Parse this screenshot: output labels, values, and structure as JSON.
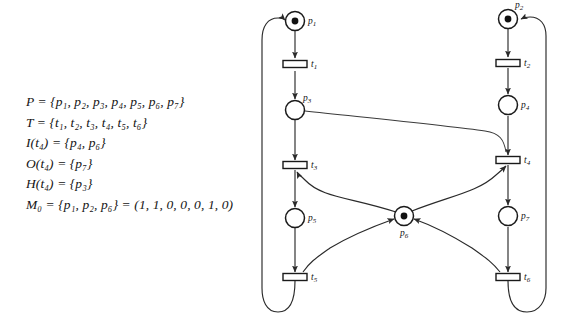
{
  "figure": {
    "kind": "petri-net-with-inhibitor-arc",
    "background_color": "#ffffff",
    "ink_color": "#1a1a1a"
  },
  "definitions": {
    "lines": [
      "P = {p₁, p₂, p₃, p₄, p₅, p₆, p₇}",
      "T = {t₁, t₂, t₃, t₄, t₅, t₆}",
      "I(t₄) = {p₄, p₆}",
      "O(t₄) = {p₇}",
      "H(t₄) = {p₃}",
      "M₀ = {p₁, p₂, p₆} = (1, 1, 0, 0, 0, 1, 0)"
    ]
  },
  "net": {
    "places": [
      {
        "id": "p1",
        "label": "p",
        "sub": "1",
        "cx": 295,
        "cy": 21,
        "r": 9.5,
        "tokens": 1,
        "label_dx": 13,
        "label_dy": 3
      },
      {
        "id": "p2",
        "label": "p",
        "sub": "2",
        "cx": 508,
        "cy": 19,
        "r": 9.5,
        "tokens": 1,
        "label_dx": 7,
        "label_dy": -11
      },
      {
        "id": "p3",
        "label": "p",
        "sub": "3",
        "cx": 295,
        "cy": 110,
        "r": 9.5,
        "tokens": 0,
        "label_dx": 8,
        "label_dy": -9
      },
      {
        "id": "p4",
        "label": "p",
        "sub": "4",
        "cx": 508,
        "cy": 105,
        "r": 9.5,
        "tokens": 0,
        "label_dx": 13,
        "label_dy": 3
      },
      {
        "id": "p5",
        "label": "p",
        "sub": "5",
        "cx": 295,
        "cy": 218,
        "r": 9.5,
        "tokens": 0,
        "label_dx": 13,
        "label_dy": 3
      },
      {
        "id": "p6",
        "label": "p",
        "sub": "6",
        "cx": 404,
        "cy": 216,
        "r": 9.5,
        "tokens": 1,
        "label_dx": -4,
        "label_dy": 20
      },
      {
        "id": "p7",
        "label": "p",
        "sub": "7",
        "cx": 508,
        "cy": 216,
        "r": 9.5,
        "tokens": 0,
        "label_dx": 13,
        "label_dy": 3
      }
    ],
    "transitions": [
      {
        "id": "t1",
        "label": "t",
        "sub": "1",
        "cx": 295,
        "cy": 64,
        "w": 24,
        "h": 7,
        "label_dx": 16,
        "label_dy": 3
      },
      {
        "id": "t2",
        "label": "t",
        "sub": "2",
        "cx": 508,
        "cy": 63,
        "w": 24,
        "h": 7,
        "label_dx": 16,
        "label_dy": 3
      },
      {
        "id": "t3",
        "label": "t",
        "sub": "3",
        "cx": 295,
        "cy": 165,
        "w": 24,
        "h": 7,
        "label_dx": 16,
        "label_dy": 3
      },
      {
        "id": "t4",
        "label": "t",
        "sub": "4",
        "cx": 508,
        "cy": 160,
        "w": 24,
        "h": 7,
        "label_dx": 16,
        "label_dy": 3
      },
      {
        "id": "t5",
        "label": "t",
        "sub": "5",
        "cx": 295,
        "cy": 277,
        "w": 24,
        "h": 7,
        "label_dx": 16,
        "label_dy": 3
      },
      {
        "id": "t6",
        "label": "t",
        "sub": "6",
        "cx": 508,
        "cy": 277,
        "w": 24,
        "h": 7,
        "label_dx": 16,
        "label_dy": 3
      }
    ],
    "arcs": [
      {
        "id": "p1-t1",
        "from": "p1",
        "to": "t1",
        "d": "M 295 31 L 295 58",
        "arrow": true
      },
      {
        "id": "t1-p3",
        "from": "t1",
        "to": "p3",
        "d": "M 295 71 L 295 99",
        "arrow": true
      },
      {
        "id": "p3-t3",
        "from": "p3",
        "to": "t3",
        "d": "M 295 120 L 295 160",
        "arrow": true
      },
      {
        "id": "t3-p5",
        "from": "t3",
        "to": "p5",
        "d": "M 295 170 L 295 207",
        "arrow": true
      },
      {
        "id": "p5-t5",
        "from": "p5",
        "to": "t5",
        "d": "M 295 228 L 295 272",
        "arrow": true
      },
      {
        "id": "p2-t2",
        "from": "p2",
        "to": "t2",
        "d": "M 508 29 L 508 57",
        "arrow": true
      },
      {
        "id": "t2-p4",
        "from": "t2",
        "to": "p4",
        "d": "M 508 68 L 508 94",
        "arrow": true
      },
      {
        "id": "p4-t4",
        "from": "p4",
        "to": "t4",
        "d": "M 508 116 L 508 155",
        "arrow": true
      },
      {
        "id": "t4-p7",
        "from": "t4",
        "to": "p7",
        "d": "M 508 165 L 508 205",
        "arrow": true
      },
      {
        "id": "p7-t6",
        "from": "p7",
        "to": "t6",
        "d": "M 508 227 L 508 272",
        "arrow": true
      },
      {
        "id": "p6-t3",
        "from": "p6",
        "to": "t3",
        "d": "M 396 212 C 350 197 322 198 305 180 C 300 175 298 174 297 172",
        "arrow": true
      },
      {
        "id": "p6-t4",
        "from": "p6",
        "to": "t4",
        "d": "M 412 211 C 450 196 478 192 496 175 C 502 170 504 168 506 166",
        "arrow": true
      },
      {
        "id": "t5-p6",
        "from": "t5",
        "to": "p6",
        "d": "M 303 272 C 310 262 316 258 330 248 C 355 233 380 224 394 219",
        "arrow": true
      },
      {
        "id": "t6-p6",
        "from": "t6",
        "to": "p6",
        "d": "M 500 272 C 492 262 486 258 472 248 C 448 233 428 224 414 219",
        "arrow": true
      },
      {
        "id": "p3-t4-inhibitor",
        "from": "p3",
        "to": "t4",
        "d": "M 305 111 C 360 117 450 126 485 131 C 500 133 504 140 506 152",
        "arrow": false
      },
      {
        "id": "t5-p1-feedback",
        "from": "t5",
        "to": "p1",
        "d": "M 295 281 C 295 300 290 312 278 312 C 266 312 262 300 262 288 L 262 40 C 262 26 268 18 278 18 C 282 18 284 19 285 20",
        "arrow": true
      },
      {
        "id": "t6-p2-feedback",
        "from": "t6",
        "to": "p2",
        "d": "M 508 281 C 508 300 514 312 527 312 C 540 312 546 300 546 288 L 546 36 C 546 24 540 17 530 17 C 526 17 523 18 521 19",
        "arrow": true
      }
    ]
  }
}
